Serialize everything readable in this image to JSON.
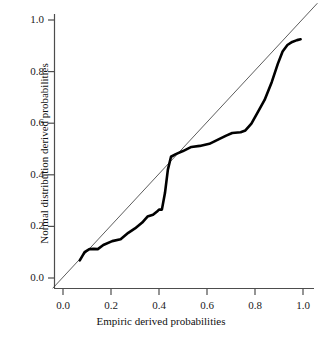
{
  "chart_data": {
    "type": "line",
    "title": "",
    "xlabel": "Empiric derived probabilities",
    "ylabel": "Normal distribution derived probabilities",
    "xlim": [
      -0.045,
      1.06
    ],
    "ylim": [
      -0.04,
      1.065
    ],
    "xticks": [
      "0.0",
      "0.2",
      "0.4",
      "0.6",
      "0.8",
      "1.0"
    ],
    "xtick_values": [
      0.0,
      0.2,
      0.4,
      0.6,
      0.8,
      1.0
    ],
    "yticks": [
      "0.0",
      "0.2",
      "0.4",
      "0.6",
      "0.8",
      "1.0"
    ],
    "ytick_values": [
      0.0,
      0.2,
      0.4,
      0.6,
      0.8,
      1.0
    ],
    "grid": false,
    "legend": "none",
    "series": [
      {
        "name": "reference-line",
        "style": "thin-diagonal",
        "color": "#333333",
        "width": 0.8,
        "x": [
          -0.043,
          1.06
        ],
        "values": [
          -0.04,
          1.065
        ]
      },
      {
        "name": "pp-curve",
        "style": "thick-solid",
        "color": "#000000",
        "width": 2.6,
        "x": [
          0.07,
          0.09,
          0.11,
          0.128,
          0.145,
          0.168,
          0.205,
          0.24,
          0.272,
          0.3,
          0.33,
          0.352,
          0.375,
          0.392,
          0.4,
          0.412,
          0.425,
          0.437,
          0.45,
          0.47,
          0.5,
          0.535,
          0.57,
          0.61,
          0.65,
          0.68,
          0.705,
          0.74,
          0.76,
          0.785,
          0.81,
          0.84,
          0.87,
          0.895,
          0.915,
          0.935,
          0.955,
          0.975,
          0.99
        ],
        "values": [
          0.068,
          0.1,
          0.112,
          0.113,
          0.112,
          0.128,
          0.143,
          0.15,
          0.175,
          0.192,
          0.215,
          0.238,
          0.245,
          0.258,
          0.265,
          0.265,
          0.33,
          0.42,
          0.47,
          0.48,
          0.492,
          0.508,
          0.512,
          0.52,
          0.538,
          0.552,
          0.562,
          0.565,
          0.572,
          0.598,
          0.64,
          0.69,
          0.76,
          0.83,
          0.878,
          0.903,
          0.915,
          0.922,
          0.925
        ]
      }
    ]
  }
}
